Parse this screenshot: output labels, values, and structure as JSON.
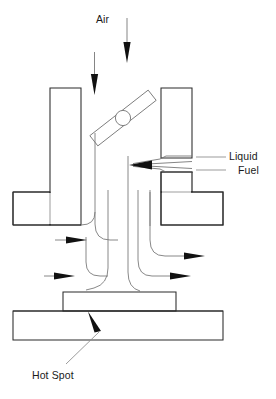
{
  "figure": {
    "type": "technical-line-diagram",
    "width": 276,
    "height": 399,
    "background_color": "#ffffff"
  },
  "labels": {
    "air": "Air",
    "liquid_fuel_line1": "Liquid",
    "liquid_fuel_line2": "Fuel",
    "hot_spot": "Hot Spot"
  },
  "colors": {
    "outline": "#2b2b2b",
    "hatch": "#707070",
    "flow": "#7a7a7a",
    "arrow_fill": "#111111",
    "text": "#1a1a1a",
    "background": "#ffffff"
  },
  "components": {
    "left_wall": {
      "name": "left-manifold-wall",
      "hatched": true,
      "bounds": {
        "x": 50,
        "y": 88,
        "w": 31,
        "h": 137
      }
    },
    "left_flange": {
      "name": "left-manifold-flange",
      "hatched": true,
      "bounds": {
        "x": 13,
        "y": 192,
        "w": 68,
        "h": 33
      }
    },
    "right_wall_upper": {
      "name": "right-manifold-wall-upper",
      "hatched": true,
      "bounds": {
        "x": 161,
        "y": 88,
        "w": 31,
        "h": 68
      }
    },
    "right_wall_lower": {
      "name": "right-manifold-wall-lower",
      "hatched": true,
      "bounds": {
        "x": 161,
        "y": 172,
        "w": 31,
        "h": 53
      }
    },
    "right_flange": {
      "name": "right-manifold-flange",
      "hatched": true,
      "bounds": {
        "x": 161,
        "y": 192,
        "w": 62,
        "h": 33
      }
    },
    "throttle_plate": {
      "name": "throttle-plate",
      "angle_deg": -38,
      "center": {
        "x": 123,
        "y": 118
      },
      "length": 74,
      "thickness": 13
    },
    "throttle_shaft": {
      "name": "throttle-shaft",
      "center": {
        "x": 123,
        "y": 118
      },
      "radius": 7.5
    },
    "fuel_nozzle": {
      "name": "fuel-nozzle-passage",
      "tip": {
        "x": 131,
        "y": 165
      },
      "gap_y_range": [
        156,
        172
      ]
    },
    "hot_spot_block": {
      "name": "hot-spot-block",
      "hatched": true,
      "bounds": {
        "x": 63,
        "y": 292,
        "w": 113,
        "h": 19
      }
    },
    "base_plate": {
      "name": "manifold-base-plate",
      "hatched": true,
      "bounds": {
        "x": 13,
        "y": 311,
        "w": 210,
        "h": 29
      }
    }
  },
  "arrows": {
    "air_inlet": [
      {
        "name": "air-arrow-left",
        "x": 95,
        "y_start": 52,
        "y_end": 92,
        "direction": "down"
      },
      {
        "name": "air-arrow-right",
        "x": 127,
        "y_start": 18,
        "y_end": 60,
        "direction": "down"
      }
    ],
    "fuel_inlet": {
      "name": "fuel-arrow",
      "x_start": 166,
      "x_end": 131,
      "y": 165,
      "direction": "left"
    },
    "outflow": [
      {
        "name": "flow-arrow-left-upper",
        "x_start": 55,
        "x_end": 82,
        "y": 239,
        "direction": "right"
      },
      {
        "name": "flow-arrow-left-lower",
        "x_start": 44,
        "x_end": 72,
        "y": 271,
        "direction": "left-pointing-right"
      },
      {
        "name": "flow-arrow-right-upper",
        "x_start": 175,
        "x_end": 205,
        "y": 257,
        "direction": "right"
      },
      {
        "name": "flow-arrow-right-lower",
        "x_start": 208,
        "x_end": 236,
        "y": 271,
        "direction": "right"
      }
    ],
    "hot_spot_pointer": {
      "name": "hot-spot-arrow",
      "tip": {
        "x": 90,
        "y": 314
      },
      "tail": {
        "x": 99,
        "y": 333
      }
    }
  },
  "leaders": {
    "liquid_fuel": {
      "name": "liquid-fuel-leader",
      "from": {
        "x": 196,
        "y": 160
      },
      "to": {
        "x": 224,
        "y": 160
      }
    },
    "hot_spot": {
      "name": "hot-spot-leader",
      "from": {
        "x": 98,
        "y": 334
      },
      "to": {
        "x": 66,
        "y": 364
      }
    }
  },
  "flow_lines": [
    {
      "name": "flow-line-outer-left",
      "description": "left boundary streamline curving left at bottom"
    },
    {
      "name": "flow-line-inner-left",
      "description": "inner left streamline curving left at bottom"
    },
    {
      "name": "flow-line-center",
      "description": "center streamline descending to hot spot"
    },
    {
      "name": "flow-line-inner-right",
      "description": "inner right streamline curving right at bottom"
    },
    {
      "name": "flow-line-outer-right",
      "description": "outer right streamline curving right at bottom"
    }
  ]
}
